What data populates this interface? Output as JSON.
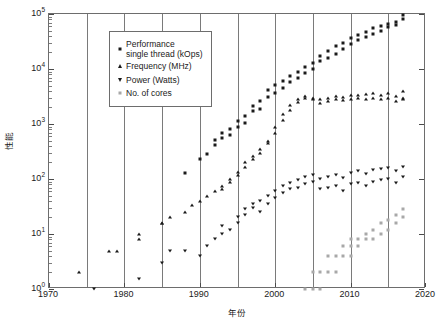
{
  "chart_data": {
    "type": "scatter",
    "title": "",
    "xlabel": "年份",
    "ylabel": "性能",
    "xlim": [
      1970,
      2020
    ],
    "ylim": [
      1,
      100000
    ],
    "yscale": "log",
    "xticks": [
      1970,
      1980,
      1990,
      2000,
      2010,
      2020
    ],
    "xticklabels": [
      "1970",
      "1980",
      "1990",
      "2000",
      "2010",
      "2020"
    ],
    "yticks": [
      1,
      10,
      100,
      1000,
      10000,
      100000
    ],
    "yticklabels": [
      "10",
      "10",
      "10",
      "10",
      "10",
      "10"
    ],
    "yticklabel_exponents": [
      "0",
      "1",
      "2",
      "3",
      "4",
      "5"
    ],
    "grid": "vertical-only",
    "gridlines_x": [
      1975,
      1980,
      1985,
      1990,
      1995,
      2000,
      2005,
      2010,
      2015
    ],
    "legend_position": "top-left",
    "series": [
      {
        "name": "Performance\nsingle thread (kOps)",
        "marker": "square",
        "color": "#1a1a1a",
        "points": [
          [
            1988,
            130
          ],
          [
            1990,
            230
          ],
          [
            1991,
            290
          ],
          [
            1992,
            420
          ],
          [
            1992,
            510
          ],
          [
            1993,
            700
          ],
          [
            1993,
            560
          ],
          [
            1994,
            620
          ],
          [
            1994,
            820
          ],
          [
            1995,
            900
          ],
          [
            1995,
            1150
          ],
          [
            1996,
            1400
          ],
          [
            1996,
            1050
          ],
          [
            1997,
            1700
          ],
          [
            1997,
            2100
          ],
          [
            1998,
            2600
          ],
          [
            1998,
            1900
          ],
          [
            1999,
            3100
          ],
          [
            1999,
            4200
          ],
          [
            2000,
            3600
          ],
          [
            2000,
            5200
          ],
          [
            2001,
            6100
          ],
          [
            2001,
            4500
          ],
          [
            2002,
            7500
          ],
          [
            2002,
            5800
          ],
          [
            2003,
            9000
          ],
          [
            2003,
            7000
          ],
          [
            2004,
            11000
          ],
          [
            2004,
            8500
          ],
          [
            2005,
            13000
          ],
          [
            2005,
            10000
          ],
          [
            2006,
            17000
          ],
          [
            2006,
            14000
          ],
          [
            2007,
            21000
          ],
          [
            2007,
            16000
          ],
          [
            2008,
            26000
          ],
          [
            2008,
            19000
          ],
          [
            2009,
            30000
          ],
          [
            2009,
            23000
          ],
          [
            2010,
            36000
          ],
          [
            2010,
            28000
          ],
          [
            2011,
            42000
          ],
          [
            2011,
            33000
          ],
          [
            2012,
            48000
          ],
          [
            2012,
            38000
          ],
          [
            2013,
            55000
          ],
          [
            2013,
            44000
          ],
          [
            2014,
            60000
          ],
          [
            2014,
            50000
          ],
          [
            2015,
            66000
          ],
          [
            2015,
            57000
          ],
          [
            2016,
            72000
          ],
          [
            2016,
            62000
          ],
          [
            2017,
            80000
          ],
          [
            2017,
            95000
          ]
        ]
      },
      {
        "name": "Frequency (MHz)",
        "marker": "triangle-up",
        "color": "#1a1a1a",
        "points": [
          [
            1974,
            2
          ],
          [
            1978,
            5
          ],
          [
            1979,
            5
          ],
          [
            1982,
            8
          ],
          [
            1982,
            10
          ],
          [
            1985,
            16
          ],
          [
            1985,
            16
          ],
          [
            1986,
            20
          ],
          [
            1988,
            25
          ],
          [
            1989,
            33
          ],
          [
            1990,
            40
          ],
          [
            1991,
            50
          ],
          [
            1992,
            60
          ],
          [
            1993,
            66
          ],
          [
            1993,
            75
          ],
          [
            1994,
            90
          ],
          [
            1994,
            100
          ],
          [
            1995,
            120
          ],
          [
            1995,
            133
          ],
          [
            1996,
            166
          ],
          [
            1996,
            200
          ],
          [
            1997,
            233
          ],
          [
            1997,
            266
          ],
          [
            1998,
            300
          ],
          [
            1998,
            350
          ],
          [
            1999,
            450
          ],
          [
            1999,
            500
          ],
          [
            2000,
            700
          ],
          [
            2000,
            900
          ],
          [
            2001,
            1200
          ],
          [
            2001,
            1500
          ],
          [
            2002,
            1800
          ],
          [
            2002,
            2200
          ],
          [
            2003,
            2500
          ],
          [
            2003,
            2800
          ],
          [
            2004,
            3000
          ],
          [
            2004,
            3200
          ],
          [
            2005,
            2800
          ],
          [
            2005,
            3000
          ],
          [
            2006,
            2400
          ],
          [
            2006,
            2900
          ],
          [
            2007,
            2600
          ],
          [
            2007,
            3000
          ],
          [
            2008,
            2800
          ],
          [
            2008,
            3200
          ],
          [
            2009,
            2700
          ],
          [
            2009,
            3100
          ],
          [
            2010,
            2900
          ],
          [
            2010,
            3300
          ],
          [
            2011,
            3000
          ],
          [
            2011,
            3400
          ],
          [
            2012,
            2800
          ],
          [
            2012,
            3500
          ],
          [
            2013,
            3000
          ],
          [
            2013,
            3600
          ],
          [
            2014,
            2900
          ],
          [
            2014,
            3400
          ],
          [
            2015,
            3000
          ],
          [
            2015,
            3700
          ],
          [
            2016,
            2600
          ],
          [
            2016,
            3200
          ],
          [
            2017,
            2800
          ],
          [
            2017,
            3000
          ],
          [
            2017,
            4000
          ]
        ]
      },
      {
        "name": "Power (Watts)",
        "marker": "triangle-down",
        "color": "#1a1a1a",
        "points": [
          [
            1976,
            1
          ],
          [
            1982,
            1.5
          ],
          [
            1985,
            3
          ],
          [
            1986,
            5
          ],
          [
            1988,
            5
          ],
          [
            1990,
            4
          ],
          [
            1991,
            6
          ],
          [
            1992,
            8
          ],
          [
            1993,
            10
          ],
          [
            1993,
            14
          ],
          [
            1994,
            12
          ],
          [
            1995,
            16
          ],
          [
            1995,
            20
          ],
          [
            1996,
            22
          ],
          [
            1996,
            28
          ],
          [
            1997,
            30
          ],
          [
            1997,
            35
          ],
          [
            1998,
            25
          ],
          [
            1998,
            40
          ],
          [
            1999,
            35
          ],
          [
            1999,
            50
          ],
          [
            2000,
            45
          ],
          [
            2000,
            60
          ],
          [
            2001,
            55
          ],
          [
            2001,
            75
          ],
          [
            2002,
            65
          ],
          [
            2002,
            85
          ],
          [
            2003,
            70
          ],
          [
            2003,
            95
          ],
          [
            2004,
            80
          ],
          [
            2004,
            110
          ],
          [
            2005,
            90
          ],
          [
            2005,
            120
          ],
          [
            2006,
            65
          ],
          [
            2006,
            100
          ],
          [
            2007,
            70
          ],
          [
            2007,
            110
          ],
          [
            2008,
            75
          ],
          [
            2008,
            120
          ],
          [
            2009,
            60
          ],
          [
            2009,
            105
          ],
          [
            2010,
            80
          ],
          [
            2010,
            130
          ],
          [
            2011,
            85
          ],
          [
            2011,
            140
          ],
          [
            2012,
            75
          ],
          [
            2012,
            125
          ],
          [
            2013,
            90
          ],
          [
            2013,
            145
          ],
          [
            2014,
            95
          ],
          [
            2014,
            150
          ],
          [
            2015,
            100
          ],
          [
            2015,
            160
          ],
          [
            2016,
            85
          ],
          [
            2016,
            140
          ],
          [
            2017,
            110
          ],
          [
            2017,
            165
          ]
        ]
      },
      {
        "name": "No. of cores",
        "marker": "square",
        "color": "#a8a8a8",
        "points": [
          [
            2004,
            1
          ],
          [
            2005,
            1
          ],
          [
            2005,
            2
          ],
          [
            2006,
            1
          ],
          [
            2006,
            2
          ],
          [
            2007,
            2
          ],
          [
            2007,
            4
          ],
          [
            2008,
            2
          ],
          [
            2008,
            4
          ],
          [
            2009,
            4
          ],
          [
            2009,
            6
          ],
          [
            2010,
            4
          ],
          [
            2010,
            6
          ],
          [
            2010,
            8
          ],
          [
            2011,
            6
          ],
          [
            2011,
            8
          ],
          [
            2012,
            8
          ],
          [
            2012,
            10
          ],
          [
            2013,
            8
          ],
          [
            2013,
            12
          ],
          [
            2014,
            10
          ],
          [
            2014,
            16
          ],
          [
            2015,
            12
          ],
          [
            2015,
            18
          ],
          [
            2016,
            16
          ],
          [
            2016,
            22
          ],
          [
            2017,
            20
          ],
          [
            2017,
            28
          ]
        ]
      }
    ]
  },
  "legend": {
    "items": [
      {
        "label": "Performance\nsingle thread (kOps)",
        "marker": "square-black"
      },
      {
        "label": "Frequency (MHz)",
        "marker": "triangle-up-black"
      },
      {
        "label": "Power (Watts)",
        "marker": "triangle-down-black"
      },
      {
        "label": "No. of cores",
        "marker": "square-gray"
      }
    ]
  },
  "colors": {
    "marker_black": "#1a1a1a",
    "marker_gray": "#a8a8a8",
    "frame": "#6d6d6d",
    "gridline": "#7a7a7a",
    "background": "#ffffff"
  }
}
